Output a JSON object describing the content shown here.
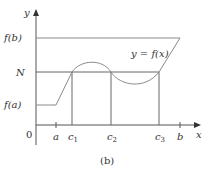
{
  "figure": {
    "caption": "(b)",
    "curve_label": "y = f(x)",
    "axes": {
      "x_label": "x",
      "y_label": "y",
      "origin_label": "0"
    },
    "y_levels": [
      {
        "label": "f(b)",
        "key": "fb"
      },
      {
        "label": "N",
        "key": "N"
      },
      {
        "label": "f(a)",
        "key": "fa"
      }
    ],
    "x_marks": [
      {
        "label": "a",
        "key": "a"
      },
      {
        "label": "c",
        "sub": "1",
        "key": "c1"
      },
      {
        "label": "c",
        "sub": "2",
        "key": "c2"
      },
      {
        "label": "c",
        "sub": "3",
        "key": "c3"
      },
      {
        "label": "b",
        "key": "b"
      }
    ],
    "colors": {
      "axis": "#555555",
      "curve": "#8a8a8a",
      "guide": "#666666",
      "text": "#333333"
    }
  }
}
